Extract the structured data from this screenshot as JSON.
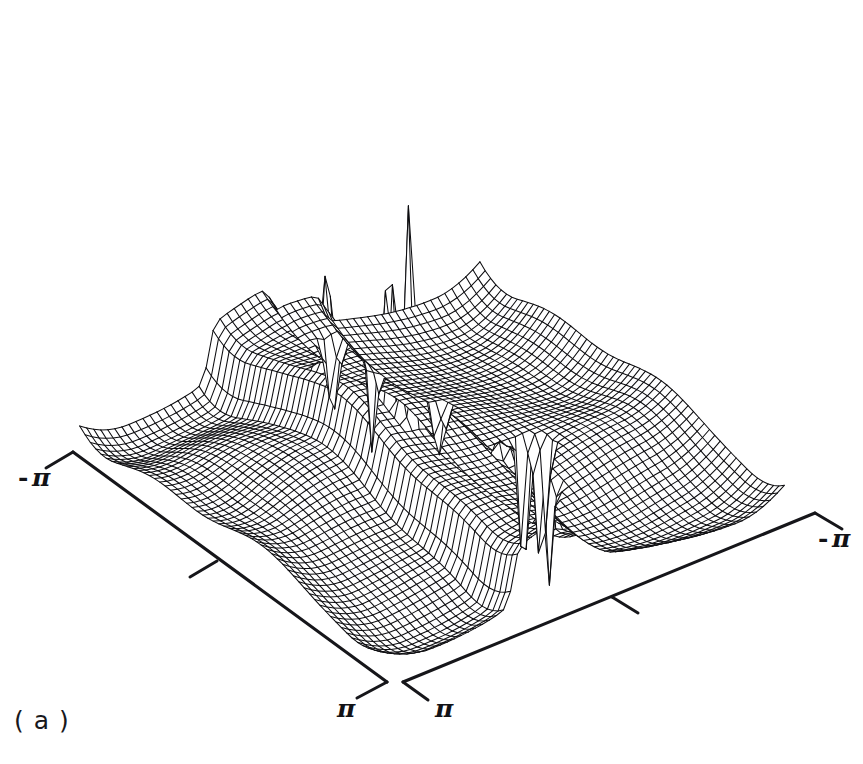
{
  "figure": {
    "caption": "( a )",
    "background_color": "#ffffff",
    "ink_color": "#0d0d10",
    "width": 863,
    "height": 764
  },
  "axes": {
    "left": {
      "name": "left-axis",
      "start_label": "- π",
      "end_label": "π",
      "start_point": [
        73,
        452
      ],
      "end_point": [
        387,
        682
      ],
      "start_tick": [
        46,
        468
      ],
      "mid_tick_base": [
        217,
        561
      ],
      "mid_tick_end": [
        190,
        577
      ],
      "end_tick": [
        357,
        698
      ],
      "label_min": {
        "minus": "-",
        "symbol": "π",
        "x": 18,
        "y": 463
      },
      "label_max": {
        "minus": "",
        "symbol": "π",
        "x": 334,
        "y": 694
      }
    },
    "right": {
      "name": "right-axis",
      "start_label": "π",
      "end_label": "- π",
      "start_point": [
        403,
        682
      ],
      "end_point": [
        815,
        513
      ],
      "start_tick": [
        428,
        700
      ],
      "mid_tick_base": [
        612,
        597
      ],
      "mid_tick_end": [
        638,
        613
      ],
      "end_tick": [
        842,
        529
      ],
      "label_min": {
        "minus": "",
        "symbol": "π",
        "x": 432,
        "y": 694
      },
      "label_max": {
        "minus": "-",
        "symbol": "π",
        "x": 818,
        "y": 524
      }
    }
  },
  "chart_data": {
    "type": "surface",
    "render": "wireframe-mesh-3d",
    "title": "",
    "subtitle": "",
    "xlabel": "",
    "ylabel": "",
    "zlabel": "",
    "xlim": [
      -3.141592653589793,
      3.141592653589793
    ],
    "ylim": [
      -3.141592653589793,
      3.141592653589793
    ],
    "x_tick_labels": [
      "- π",
      "π"
    ],
    "y_tick_labels": [
      "π",
      "- π"
    ],
    "x_tick_count": 3,
    "y_tick_count": 3,
    "grid": false,
    "legend": null,
    "mesh_rows": 58,
    "mesh_cols": 58,
    "hidden_line_removal": true,
    "projection": {
      "type": "oblique-isometric",
      "origin_x": 432,
      "origin_y": 470,
      "u_vector": [
        5.34,
        3.92
      ],
      "v_vector": [
        7.02,
        -2.88
      ],
      "z_scale": 78.0,
      "z_clip_low": -1.35
    },
    "surface_model": {
      "description": "Rippled base sheet with terraced plateau ridge and narrow singular spikes, characteristic of a 2-D spectral estimate over [-pi,pi]^2.",
      "base_amplitude": 0.205,
      "base_waves": [
        {
          "kx": 1.0,
          "ky": 0.0,
          "amp": 0.175,
          "phase": 0.35
        },
        {
          "kx": 0.0,
          "ky": 1.0,
          "amp": 0.145,
          "phase": 1.1
        },
        {
          "kx": 1.0,
          "ky": 1.0,
          "amp": 0.09,
          "phase": 2.2
        },
        {
          "kx": 2.0,
          "ky": -1.0,
          "amp": 0.062,
          "phase": 0.8
        },
        {
          "kx": -1.0,
          "ky": 2.0,
          "amp": 0.055,
          "phase": 2.95
        },
        {
          "kx": 3.0,
          "ky": 1.0,
          "amp": 0.03,
          "phase": 1.75
        }
      ],
      "terraces": [
        {
          "name": "upper-plateau",
          "axis": "v",
          "center": -0.62,
          "half_width": 0.5,
          "height": 0.7,
          "sharpness": 26.0
        },
        {
          "name": "lower-step",
          "axis": "v",
          "center": 0.3,
          "half_width": 0.38,
          "height": 0.36,
          "sharpness": 30.0
        }
      ],
      "spikes": [
        {
          "name": "spike-top-center-tall",
          "x": -0.12,
          "y": -0.55,
          "height": 3.62,
          "width": 0.052,
          "sign": 1
        },
        {
          "name": "spike-top-center-second",
          "x": 0.16,
          "y": -0.47,
          "height": 2.92,
          "width": 0.068,
          "sign": 1
        },
        {
          "name": "spike-upper-left",
          "x": -1.22,
          "y": -0.72,
          "height": 1.6,
          "width": 0.06,
          "sign": 1
        },
        {
          "name": "spike-right-tall",
          "x": 1.62,
          "y": -0.3,
          "height": 2.05,
          "width": 0.05,
          "sign": 1
        },
        {
          "name": "spike-far-right",
          "x": 2.32,
          "y": 0.05,
          "height": 1.42,
          "width": 0.058,
          "sign": 1
        },
        {
          "name": "spike-left-lip",
          "x": -2.42,
          "y": 0.28,
          "height": 1.05,
          "width": 0.072,
          "sign": -1
        },
        {
          "name": "spike-left-down",
          "x": -2.05,
          "y": 0.62,
          "height": 1.3,
          "width": 0.055,
          "sign": -1
        },
        {
          "name": "spike-front-center-a",
          "x": 0.22,
          "y": 1.28,
          "height": 2.55,
          "width": 0.05,
          "sign": -1
        },
        {
          "name": "spike-front-center-b",
          "x": 0.4,
          "y": 1.42,
          "height": 2.2,
          "width": 0.062,
          "sign": -1
        },
        {
          "name": "spike-front-right",
          "x": 1.05,
          "y": 1.05,
          "height": 1.35,
          "width": 0.052,
          "sign": -1
        },
        {
          "name": "spike-front-up",
          "x": 0.28,
          "y": 0.92,
          "height": 1.85,
          "width": 0.048,
          "sign": 1
        },
        {
          "name": "spike-mid-left-down",
          "x": -0.98,
          "y": 0.86,
          "height": 0.95,
          "width": 0.058,
          "sign": -1
        }
      ],
      "edge_curl": {
        "amp": 0.55,
        "decay": 0.42
      }
    }
  }
}
